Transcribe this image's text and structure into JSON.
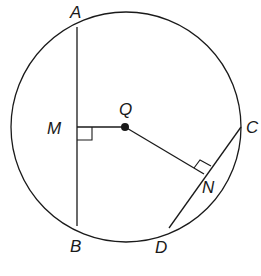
{
  "diagram": {
    "type": "circle-chords",
    "circle": {
      "center_label": "Q"
    },
    "points": {
      "A": "A",
      "B": "B",
      "C": "C",
      "D": "D",
      "M": "M",
      "N": "N",
      "Q": "Q"
    },
    "segments": [
      "AB",
      "CD",
      "QM",
      "QN"
    ],
    "right_angles": [
      "QMA",
      "QNC"
    ],
    "stroke_color": "#1a1a1a",
    "background": "#ffffff"
  }
}
